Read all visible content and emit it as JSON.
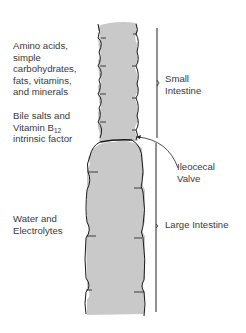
{
  "diagram": {
    "left_labels": {
      "absorbed_small_1": [
        "Amino acids,",
        "simple",
        "carbohydrates,",
        "fats, vitamins,",
        "and minerals"
      ],
      "absorbed_small_2_line1": "Bile salts and",
      "absorbed_small_2_line2_prefix": "Vitamin B",
      "absorbed_small_2_line2_sub": "12",
      "absorbed_small_2_line3": "intrinsic factor",
      "absorbed_large": [
        "Water and",
        "Electrolytes"
      ]
    },
    "right_labels": {
      "small_intestine": [
        "Small",
        "Intestine"
      ],
      "ileocecal_valve": [
        "Ileocecal",
        "Valve"
      ],
      "large_intestine": "Large Intestine"
    },
    "colors": {
      "tube_fill": "#c9c9c9",
      "outline": "#1a1a1a",
      "text": "#3a3a3a"
    }
  }
}
